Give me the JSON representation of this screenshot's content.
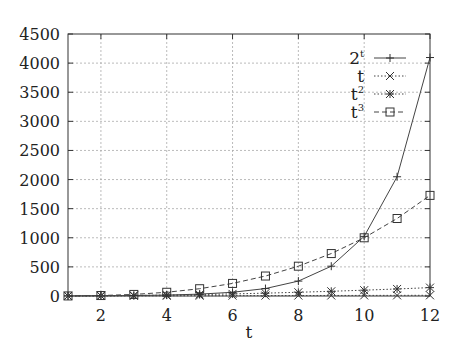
{
  "chart_data": {
    "type": "line",
    "title": "",
    "xlabel": "t",
    "ylabel": "",
    "xlim": [
      1,
      12
    ],
    "ylim": [
      0,
      4500
    ],
    "x": [
      1,
      2,
      3,
      4,
      5,
      6,
      7,
      8,
      9,
      10,
      11,
      12
    ],
    "xticks": [
      2,
      4,
      6,
      8,
      10,
      12
    ],
    "yticks": [
      0,
      500,
      1000,
      1500,
      2000,
      2500,
      3000,
      3500,
      4000,
      4500
    ],
    "grid": true,
    "legend_position": "upper-right-inside",
    "series": [
      {
        "name": "2^t",
        "label_base": "2",
        "label_sup": "t",
        "marker": "plus",
        "line": "solid",
        "values": [
          2,
          4,
          8,
          16,
          32,
          64,
          128,
          256,
          512,
          1024,
          2048,
          4096
        ]
      },
      {
        "name": "t",
        "label_base": "t",
        "label_sup": "",
        "marker": "x",
        "line": "dotted",
        "values": [
          1,
          2,
          3,
          4,
          5,
          6,
          7,
          8,
          9,
          10,
          11,
          12
        ]
      },
      {
        "name": "t^2",
        "label_base": "t",
        "label_sup": "2",
        "marker": "star",
        "line": "dotted",
        "values": [
          1,
          4,
          9,
          16,
          25,
          36,
          49,
          64,
          81,
          100,
          121,
          144
        ]
      },
      {
        "name": "t^3",
        "label_base": "t",
        "label_sup": "3",
        "marker": "square",
        "line": "dashed",
        "values": [
          1,
          8,
          27,
          64,
          125,
          216,
          343,
          512,
          729,
          1000,
          1331,
          1728
        ]
      }
    ]
  }
}
